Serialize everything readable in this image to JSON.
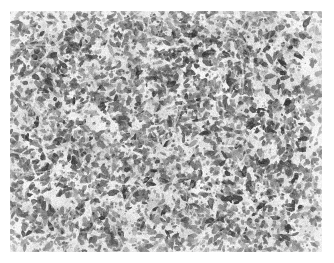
{
  "figure": {
    "kind": "histopathology-micrograph",
    "modality": "light-microscopy",
    "stain_appearance": "grayscale",
    "title": "",
    "caption": "",
    "scale_bar_text": "",
    "annotation_text": "",
    "has_text_labels": false,
    "has_scale_bar": false
  },
  "canvas": {
    "width": 334,
    "height": 263,
    "background_color": "#ffffff"
  },
  "image_region": {
    "x": 10,
    "y": 11,
    "width": 312,
    "height": 241,
    "border_color": "#ffffff"
  },
  "tissue": {
    "description": "densely cellular tissue section with small irregular dark nuclei on pale cytoplasmic background",
    "background_tone": "#e4e4e4",
    "paper_tone": "#f2f2f2",
    "nucleus_dark": "#3f3f3f",
    "nucleus_mid": "#6e6e6e",
    "nucleus_light": "#9a9a9a",
    "clearing_tone": "#f6f6f6",
    "mean_gray": "#d6d6d6",
    "nucleus_count": 5200,
    "nucleus_min_px": 2.2,
    "nucleus_max_px": 5.6,
    "cellularity": "high",
    "grain_amount": 0.2,
    "seed": 20240917
  },
  "density_field": [
    {
      "cx": 0.46,
      "cy": 0.3,
      "radius": 0.4,
      "strength": 0.26
    },
    {
      "cx": 0.24,
      "cy": 0.62,
      "radius": 0.34,
      "strength": 0.16
    },
    {
      "cx": 0.72,
      "cy": 0.72,
      "radius": 0.32,
      "strength": 0.18
    },
    {
      "cx": 0.66,
      "cy": 0.2,
      "radius": 0.26,
      "strength": 0.14
    },
    {
      "cx": 0.12,
      "cy": 0.18,
      "radius": 0.24,
      "strength": 0.1
    }
  ],
  "clearings": [
    {
      "cx": 0.955,
      "cy": 0.22,
      "rx": 0.035,
      "ry": 0.115,
      "angle": -18,
      "strength": 0.88
    },
    {
      "cx": 0.9,
      "cy": 0.06,
      "rx": 0.055,
      "ry": 0.04,
      "angle": 12,
      "strength": 0.55
    },
    {
      "cx": 0.985,
      "cy": 0.52,
      "rx": 0.03,
      "ry": 0.09,
      "angle": 4,
      "strength": 0.6
    },
    {
      "cx": 0.3,
      "cy": 0.47,
      "rx": 0.075,
      "ry": 0.04,
      "angle": 28,
      "strength": 0.42
    },
    {
      "cx": 0.57,
      "cy": 0.56,
      "rx": 0.07,
      "ry": 0.035,
      "angle": -14,
      "strength": 0.38
    },
    {
      "cx": 0.15,
      "cy": 0.78,
      "rx": 0.06,
      "ry": 0.038,
      "angle": 40,
      "strength": 0.34
    },
    {
      "cx": 0.8,
      "cy": 0.4,
      "rx": 0.055,
      "ry": 0.032,
      "angle": -32,
      "strength": 0.32
    },
    {
      "cx": 0.42,
      "cy": 0.86,
      "rx": 0.065,
      "ry": 0.03,
      "angle": 10,
      "strength": 0.3
    },
    {
      "cx": 0.66,
      "cy": 0.93,
      "rx": 0.05,
      "ry": 0.028,
      "angle": -22,
      "strength": 0.28
    },
    {
      "cx": 0.08,
      "cy": 0.34,
      "rx": 0.045,
      "ry": 0.03,
      "angle": 55,
      "strength": 0.26
    }
  ]
}
